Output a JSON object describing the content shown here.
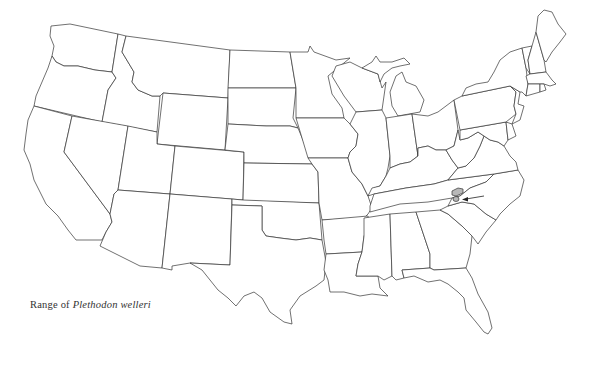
{
  "map": {
    "title": "Range of Plethodon welleri",
    "caption": {
      "prefix": "Range of",
      "species": "Plethodon welleri"
    },
    "region": "Contiguous United States",
    "style": "state outline line drawing",
    "colors": {
      "outline": "#333333",
      "background": "#ffffff",
      "range_fill": "#b8b8b8"
    },
    "highlighted_range": {
      "location": "Tennessee / North Carolina / Virginia border (southern Appalachians)",
      "marker": "arrow pointing to range"
    },
    "states": [
      "WA",
      "OR",
      "CA",
      "ID",
      "NV",
      "MT",
      "WY",
      "UT",
      "AZ",
      "CO",
      "NM",
      "ND",
      "SD",
      "NE",
      "KS",
      "OK",
      "TX",
      "MN",
      "IA",
      "MO",
      "AR",
      "LA",
      "WI",
      "IL",
      "MI",
      "IN",
      "OH",
      "KY",
      "TN",
      "MS",
      "AL",
      "GA",
      "FL",
      "SC",
      "NC",
      "VA",
      "WV",
      "PA",
      "NY",
      "NJ",
      "DE",
      "MD",
      "VT",
      "NH",
      "ME",
      "MA",
      "CT",
      "RI"
    ]
  }
}
